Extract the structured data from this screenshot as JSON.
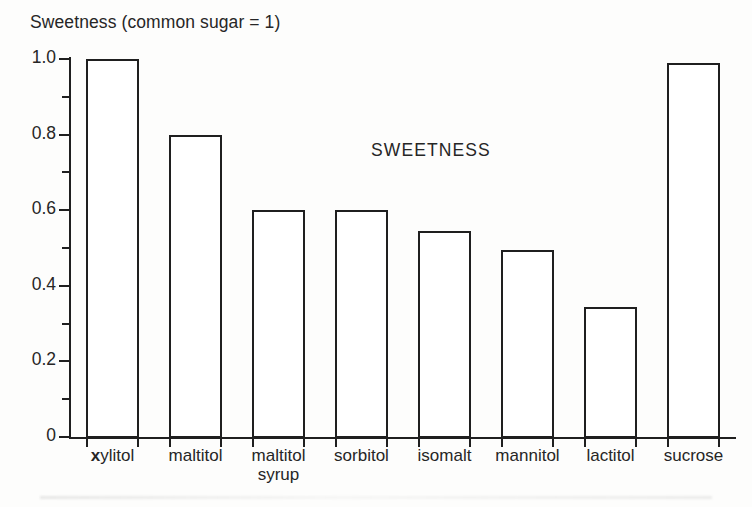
{
  "figure": {
    "axis_title": "Sweetness (common sugar = 1)",
    "annotation": "SWEETNESS"
  },
  "chart_data": {
    "type": "bar",
    "title": "Sweetness (common sugar = 1)",
    "annotation": "SWEETNESS",
    "xlabel": "",
    "ylabel": "Sweetness (common sugar = 1)",
    "ylim": [
      0,
      1.0
    ],
    "grid": false,
    "legend": "none",
    "categories": [
      "xylitol",
      "maltitol",
      "maltitol syrup",
      "sorbitol",
      "isomalt",
      "mannitol",
      "lactitol",
      "sucrose"
    ],
    "values": [
      1.0,
      0.8,
      0.6,
      0.6,
      0.545,
      0.495,
      0.345,
      0.99
    ],
    "y_ticks_major": [
      "1.0",
      "0.8",
      "0.6",
      "0.4",
      "0.2",
      "0"
    ],
    "y_tick_values": [
      1.0,
      0.8,
      0.6,
      0.4,
      0.2,
      0
    ],
    "y_ticks_minor": [
      0.9,
      0.7,
      0.5,
      0.3,
      0.1
    ],
    "bar_style": {
      "facecolor": "#ffffff",
      "edgecolor": "#1f1f1f"
    }
  },
  "x_labels": [
    {
      "lead": "x",
      "rest": "ylitol",
      "line2": ""
    },
    {
      "lead": "",
      "rest": "maltitol",
      "line2": ""
    },
    {
      "lead": "",
      "rest": "maltitol",
      "line2": "syrup"
    },
    {
      "lead": "",
      "rest": "sorbitol",
      "line2": ""
    },
    {
      "lead": "",
      "rest": "isomalt",
      "line2": ""
    },
    {
      "lead": "",
      "rest": "mannitol",
      "line2": ""
    },
    {
      "lead": "",
      "rest": "lactitol",
      "line2": ""
    },
    {
      "lead": "",
      "rest": "sucrose",
      "line2": ""
    }
  ]
}
